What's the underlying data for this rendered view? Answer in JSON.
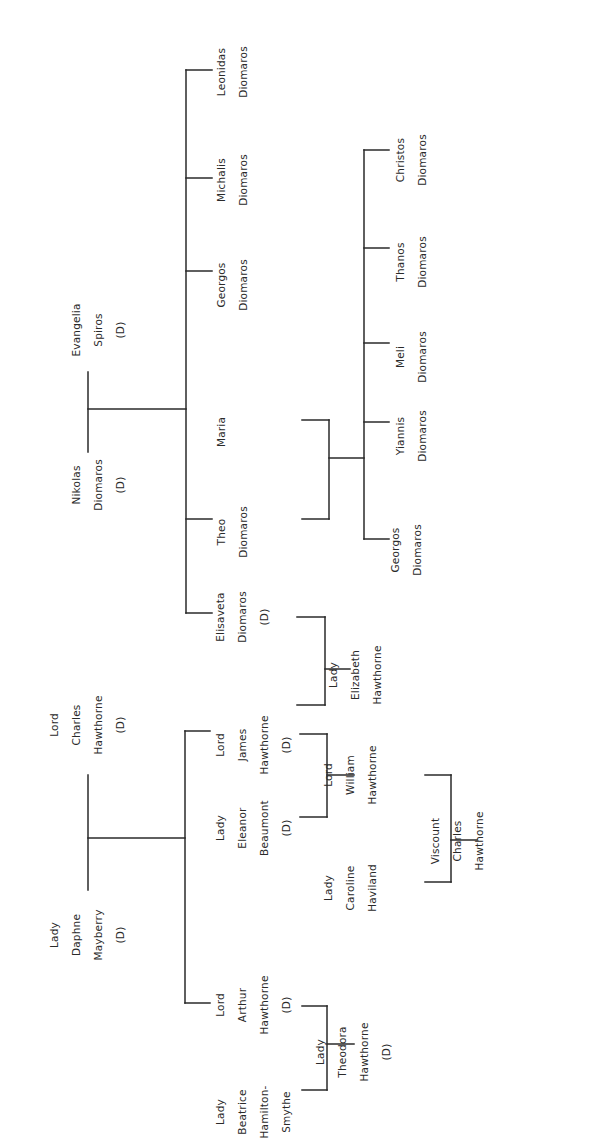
{
  "deceased_marker": "(D)",
  "line_color": "#2a2a2a",
  "people": {
    "leonidas": [
      "Leonidas",
      "Diomaros"
    ],
    "michalis": [
      "Michalis",
      "Diomaros"
    ],
    "georgos_elder": [
      "Georgos",
      "Diomaros"
    ],
    "evangelia": [
      "Evangelia",
      "Spiros",
      "(D)"
    ],
    "nikolas": [
      "Nikolas",
      "Diomaros",
      "(D)"
    ],
    "maria": [
      "Maria"
    ],
    "theo": [
      "Theo",
      "Diomaros"
    ],
    "elisaveta": [
      "Elisaveta",
      "Diomaros",
      "(D)"
    ],
    "christos": [
      "Christos",
      "Diomaros"
    ],
    "thanos": [
      "Thanos",
      "Diomaros"
    ],
    "meli": [
      "Meli",
      "Diomaros"
    ],
    "yiannis": [
      "Yiannis",
      "Diomaros"
    ],
    "georgos_younger": [
      "Georgos",
      "Diomaros"
    ],
    "lord_charles": [
      "Lord",
      "Charles",
      "Hawthorne",
      "(D)"
    ],
    "lady_daphne": [
      "Lady",
      "Daphne",
      "Mayberry",
      "(D)"
    ],
    "lord_james": [
      "Lord",
      "James",
      "Hawthorne",
      "(D)"
    ],
    "lady_eleanor": [
      "Lady",
      "Eleanor",
      "Beaumont",
      "(D)"
    ],
    "lord_arthur": [
      "Lord",
      "Arthur",
      "Hawthorne",
      "(D)"
    ],
    "lady_beatrice": [
      "Lady",
      "Beatrice",
      "Hamilton-",
      "Smythe"
    ],
    "lady_elizabeth": [
      "Lady",
      "Elizabeth",
      "Hawthorne"
    ],
    "lord_william": [
      "Lord",
      "William",
      "Hawthorne"
    ],
    "lady_caroline": [
      "Lady",
      "Caroline",
      "Haviland"
    ],
    "viscount_charles": [
      "Viscount",
      "Charles",
      "Hawthorne"
    ],
    "lady_theodora": [
      "Lady",
      "Theodora",
      "Hawthorne",
      "(D)"
    ]
  },
  "relationships": [
    {
      "couple": [
        "nikolas",
        "evangelia"
      ],
      "children": [
        "leonidas",
        "michalis",
        "georgos_elder",
        "theo",
        "elisaveta"
      ]
    },
    {
      "couple": [
        "theo",
        "maria"
      ],
      "children": [
        "christos",
        "thanos",
        "meli",
        "yiannis",
        "georgos_younger"
      ]
    },
    {
      "couple": [
        "lord_charles",
        "lady_daphne"
      ],
      "children": [
        "lord_james",
        "lord_arthur"
      ]
    },
    {
      "couple": [
        "elisaveta",
        "lord_james"
      ],
      "children": [
        "lady_elizabeth"
      ]
    },
    {
      "couple": [
        "lord_james",
        "lady_eleanor"
      ],
      "children": [
        "lord_william"
      ]
    },
    {
      "couple": [
        "lord_william",
        "lady_caroline"
      ],
      "children": [
        "viscount_charles"
      ]
    },
    {
      "couple": [
        "lord_arthur",
        "lady_beatrice"
      ],
      "children": [
        "lady_theodora"
      ]
    }
  ]
}
